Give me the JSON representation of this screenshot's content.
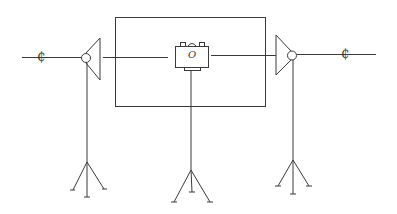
{
  "diagram": {
    "title": "",
    "symbols": {
      "left_centerline_mark": "₵",
      "right_centerline_mark": "₵",
      "camera_lens_mark": "O"
    },
    "components": [
      {
        "id": "left-light",
        "type": "lamp-on-tripod",
        "facing": "right"
      },
      {
        "id": "camera",
        "type": "camera-on-tripod"
      },
      {
        "id": "right-light",
        "type": "lamp-on-tripod",
        "facing": "left"
      },
      {
        "id": "frame",
        "type": "rectangle-field-of-view"
      }
    ],
    "colors": {
      "line": "#3a3a3a",
      "background": "#ffffff"
    }
  }
}
